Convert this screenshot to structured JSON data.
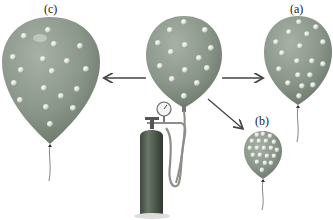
{
  "labels": {
    "a": "(a)",
    "b": "(b)",
    "c": "(c)"
  },
  "colors": {
    "balloon": "#8f9a8e",
    "balloon_dark": "#6f7a6e",
    "particle": "#e4e6e2",
    "tank": "#4e5a4c",
    "arrow": "#444444",
    "background": "#ffffff"
  },
  "balloons": [
    {
      "id": "center",
      "description": "initial balloon attached to gas tank",
      "particles": 15
    },
    {
      "id": "a",
      "description": "balloon (a)",
      "particles": 18
    },
    {
      "id": "b",
      "description": "smaller balloon (b)",
      "particles": 20
    },
    {
      "id": "c",
      "description": "larger balloon (c)",
      "particles": 20
    }
  ],
  "arrows": [
    {
      "from": "center",
      "to": "c"
    },
    {
      "from": "center",
      "to": "a"
    },
    {
      "from": "center",
      "to": "b"
    }
  ]
}
